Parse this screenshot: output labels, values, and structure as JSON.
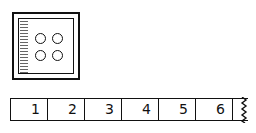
{
  "card": {
    "label": "four-dot counting card",
    "dots": 4
  },
  "number_strip": {
    "cells": [
      "1",
      "2",
      "3",
      "4",
      "5",
      "6"
    ],
    "continues": true
  },
  "colors": {
    "ink": "#111111",
    "background": "#ffffff"
  }
}
